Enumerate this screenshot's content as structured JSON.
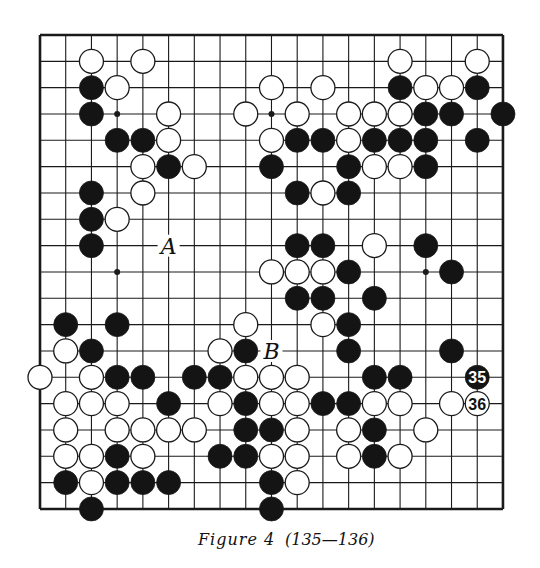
{
  "figure": {
    "caption_label": "Figure 4",
    "caption_moves": "(135—136)"
  },
  "board": {
    "size": 19,
    "origin_x": 40,
    "origin_y": 35,
    "step_x": 25.72,
    "step_y": 26.33,
    "stone_radius": 12,
    "colors": {
      "line": "#1a1a1a",
      "black": "#141414",
      "white": "#ffffff",
      "background": "#ffffff"
    },
    "star_points": [
      [
        3,
        3
      ],
      [
        3,
        9
      ],
      [
        9,
        3
      ],
      [
        9,
        15
      ],
      [
        3,
        15
      ],
      [
        15,
        3
      ],
      [
        9,
        9
      ],
      [
        15,
        9
      ],
      [
        15,
        15
      ]
    ],
    "visible_star_points": [
      [
        3,
        3
      ],
      [
        3,
        9
      ],
      [
        9,
        3
      ],
      [
        9,
        15
      ]
    ],
    "stones": [
      {
        "r": 1,
        "c": 2,
        "color": "white"
      },
      {
        "r": 1,
        "c": 4,
        "color": "white"
      },
      {
        "r": 1,
        "c": 14,
        "color": "white"
      },
      {
        "r": 1,
        "c": 17,
        "color": "white"
      },
      {
        "r": 2,
        "c": 2,
        "color": "black"
      },
      {
        "r": 2,
        "c": 3,
        "color": "white"
      },
      {
        "r": 2,
        "c": 9,
        "color": "white"
      },
      {
        "r": 2,
        "c": 11,
        "color": "white"
      },
      {
        "r": 2,
        "c": 14,
        "color": "black"
      },
      {
        "r": 2,
        "c": 15,
        "color": "white"
      },
      {
        "r": 2,
        "c": 16,
        "color": "white"
      },
      {
        "r": 2,
        "c": 17,
        "color": "black"
      },
      {
        "r": 3,
        "c": 2,
        "color": "black"
      },
      {
        "r": 3,
        "c": 5,
        "color": "white"
      },
      {
        "r": 3,
        "c": 8,
        "color": "white"
      },
      {
        "r": 3,
        "c": 10,
        "color": "white"
      },
      {
        "r": 3,
        "c": 12,
        "color": "white"
      },
      {
        "r": 3,
        "c": 13,
        "color": "white"
      },
      {
        "r": 3,
        "c": 14,
        "color": "white"
      },
      {
        "r": 3,
        "c": 15,
        "color": "black"
      },
      {
        "r": 3,
        "c": 16,
        "color": "black"
      },
      {
        "r": 3,
        "c": 18,
        "color": "black"
      },
      {
        "r": 4,
        "c": 3,
        "color": "black"
      },
      {
        "r": 4,
        "c": 4,
        "color": "black"
      },
      {
        "r": 4,
        "c": 5,
        "color": "white"
      },
      {
        "r": 4,
        "c": 9,
        "color": "white"
      },
      {
        "r": 4,
        "c": 10,
        "color": "black"
      },
      {
        "r": 4,
        "c": 11,
        "color": "black"
      },
      {
        "r": 4,
        "c": 12,
        "color": "white"
      },
      {
        "r": 4,
        "c": 13,
        "color": "black"
      },
      {
        "r": 4,
        "c": 14,
        "color": "black"
      },
      {
        "r": 4,
        "c": 15,
        "color": "black"
      },
      {
        "r": 4,
        "c": 17,
        "color": "black"
      },
      {
        "r": 5,
        "c": 4,
        "color": "white"
      },
      {
        "r": 5,
        "c": 5,
        "color": "black"
      },
      {
        "r": 5,
        "c": 6,
        "color": "white"
      },
      {
        "r": 5,
        "c": 9,
        "color": "black"
      },
      {
        "r": 5,
        "c": 12,
        "color": "black"
      },
      {
        "r": 5,
        "c": 13,
        "color": "white"
      },
      {
        "r": 5,
        "c": 14,
        "color": "white"
      },
      {
        "r": 5,
        "c": 15,
        "color": "black"
      },
      {
        "r": 6,
        "c": 2,
        "color": "black"
      },
      {
        "r": 6,
        "c": 4,
        "color": "white"
      },
      {
        "r": 6,
        "c": 10,
        "color": "black"
      },
      {
        "r": 6,
        "c": 11,
        "color": "white"
      },
      {
        "r": 6,
        "c": 12,
        "color": "black"
      },
      {
        "r": 7,
        "c": 2,
        "color": "black"
      },
      {
        "r": 7,
        "c": 3,
        "color": "white"
      },
      {
        "r": 8,
        "c": 2,
        "color": "black"
      },
      {
        "r": 8,
        "c": 10,
        "color": "black"
      },
      {
        "r": 8,
        "c": 11,
        "color": "black"
      },
      {
        "r": 8,
        "c": 13,
        "color": "white"
      },
      {
        "r": 8,
        "c": 15,
        "color": "black"
      },
      {
        "r": 9,
        "c": 9,
        "color": "white"
      },
      {
        "r": 9,
        "c": 10,
        "color": "white"
      },
      {
        "r": 9,
        "c": 11,
        "color": "white"
      },
      {
        "r": 9,
        "c": 12,
        "color": "black"
      },
      {
        "r": 9,
        "c": 16,
        "color": "black"
      },
      {
        "r": 10,
        "c": 10,
        "color": "black"
      },
      {
        "r": 10,
        "c": 11,
        "color": "black"
      },
      {
        "r": 10,
        "c": 13,
        "color": "black"
      },
      {
        "r": 11,
        "c": 1,
        "color": "black"
      },
      {
        "r": 11,
        "c": 3,
        "color": "black"
      },
      {
        "r": 11,
        "c": 8,
        "color": "white"
      },
      {
        "r": 11,
        "c": 11,
        "color": "white"
      },
      {
        "r": 11,
        "c": 12,
        "color": "black"
      },
      {
        "r": 12,
        "c": 1,
        "color": "white"
      },
      {
        "r": 12,
        "c": 2,
        "color": "black"
      },
      {
        "r": 12,
        "c": 7,
        "color": "white"
      },
      {
        "r": 12,
        "c": 8,
        "color": "black"
      },
      {
        "r": 12,
        "c": 12,
        "color": "black"
      },
      {
        "r": 12,
        "c": 16,
        "color": "black"
      },
      {
        "r": 13,
        "c": 0,
        "color": "white"
      },
      {
        "r": 13,
        "c": 2,
        "color": "white"
      },
      {
        "r": 13,
        "c": 3,
        "color": "black"
      },
      {
        "r": 13,
        "c": 4,
        "color": "black"
      },
      {
        "r": 13,
        "c": 6,
        "color": "black"
      },
      {
        "r": 13,
        "c": 7,
        "color": "black"
      },
      {
        "r": 13,
        "c": 8,
        "color": "white"
      },
      {
        "r": 13,
        "c": 9,
        "color": "white"
      },
      {
        "r": 13,
        "c": 10,
        "color": "white"
      },
      {
        "r": 13,
        "c": 13,
        "color": "black"
      },
      {
        "r": 13,
        "c": 14,
        "color": "black"
      },
      {
        "r": 13,
        "c": 17,
        "color": "black",
        "label": "35"
      },
      {
        "r": 14,
        "c": 1,
        "color": "white"
      },
      {
        "r": 14,
        "c": 2,
        "color": "white"
      },
      {
        "r": 14,
        "c": 3,
        "color": "white"
      },
      {
        "r": 14,
        "c": 5,
        "color": "black"
      },
      {
        "r": 14,
        "c": 7,
        "color": "white"
      },
      {
        "r": 14,
        "c": 8,
        "color": "black"
      },
      {
        "r": 14,
        "c": 9,
        "color": "white"
      },
      {
        "r": 14,
        "c": 10,
        "color": "white"
      },
      {
        "r": 14,
        "c": 11,
        "color": "black"
      },
      {
        "r": 14,
        "c": 12,
        "color": "black"
      },
      {
        "r": 14,
        "c": 13,
        "color": "white"
      },
      {
        "r": 14,
        "c": 14,
        "color": "white"
      },
      {
        "r": 14,
        "c": 16,
        "color": "white"
      },
      {
        "r": 14,
        "c": 17,
        "color": "white",
        "label": "36"
      },
      {
        "r": 15,
        "c": 1,
        "color": "white"
      },
      {
        "r": 15,
        "c": 3,
        "color": "white"
      },
      {
        "r": 15,
        "c": 4,
        "color": "white"
      },
      {
        "r": 15,
        "c": 5,
        "color": "white"
      },
      {
        "r": 15,
        "c": 6,
        "color": "white"
      },
      {
        "r": 15,
        "c": 8,
        "color": "black"
      },
      {
        "r": 15,
        "c": 9,
        "color": "black"
      },
      {
        "r": 15,
        "c": 10,
        "color": "white"
      },
      {
        "r": 15,
        "c": 12,
        "color": "white"
      },
      {
        "r": 15,
        "c": 13,
        "color": "black"
      },
      {
        "r": 15,
        "c": 15,
        "color": "white"
      },
      {
        "r": 16,
        "c": 1,
        "color": "white"
      },
      {
        "r": 16,
        "c": 2,
        "color": "white"
      },
      {
        "r": 16,
        "c": 3,
        "color": "black"
      },
      {
        "r": 16,
        "c": 4,
        "color": "white"
      },
      {
        "r": 16,
        "c": 7,
        "color": "black"
      },
      {
        "r": 16,
        "c": 8,
        "color": "black"
      },
      {
        "r": 16,
        "c": 9,
        "color": "white"
      },
      {
        "r": 16,
        "c": 10,
        "color": "white"
      },
      {
        "r": 16,
        "c": 12,
        "color": "white"
      },
      {
        "r": 16,
        "c": 13,
        "color": "black"
      },
      {
        "r": 16,
        "c": 14,
        "color": "white"
      },
      {
        "r": 17,
        "c": 1,
        "color": "black"
      },
      {
        "r": 17,
        "c": 2,
        "color": "white"
      },
      {
        "r": 17,
        "c": 3,
        "color": "black"
      },
      {
        "r": 17,
        "c": 4,
        "color": "black"
      },
      {
        "r": 17,
        "c": 5,
        "color": "black"
      },
      {
        "r": 17,
        "c": 9,
        "color": "black"
      },
      {
        "r": 17,
        "c": 10,
        "color": "white"
      },
      {
        "r": 18,
        "c": 2,
        "color": "black"
      },
      {
        "r": 18,
        "c": 9,
        "color": "black"
      }
    ],
    "letter_marks": [
      {
        "r": 8,
        "c": 5,
        "text": "A"
      },
      {
        "r": 12,
        "c": 9,
        "text": "B"
      }
    ]
  }
}
